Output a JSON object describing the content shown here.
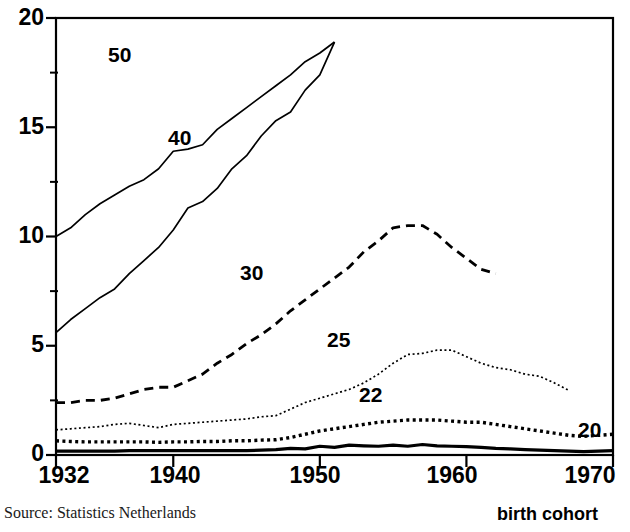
{
  "footer": {
    "source_text": "Source: Statistics Netherlands",
    "x_axis_caption": "birth cohort"
  },
  "colors": {
    "ink": "#000000",
    "background": "#ffffff"
  },
  "chart_data": {
    "type": "line",
    "title": "",
    "subtitle": "",
    "xlabel": "birth cohort",
    "ylabel": "",
    "grid": false,
    "legend_position": "inline-labels",
    "xlim": [
      1932,
      1970
    ],
    "ylim": [
      0,
      20
    ],
    "xticks": [
      1932,
      1940,
      1950,
      1960,
      1970
    ],
    "xtick_labels": [
      "1932",
      "1940",
      "1950",
      "1960",
      "1970"
    ],
    "yticks": [
      0,
      5,
      10,
      15,
      20
    ],
    "ytick_labels": [
      "0",
      "5",
      "10",
      "15",
      "20"
    ],
    "yminorticks": [
      2.5,
      7.5,
      12.5,
      17.5
    ],
    "series": [
      {
        "name": "50",
        "label": "50",
        "style": "solid-thin",
        "x": [
          1932,
          1933,
          1934,
          1935,
          1936,
          1937,
          1938,
          1939,
          1940,
          1941,
          1942,
          1943,
          1944,
          1945,
          1946,
          1947,
          1948,
          1949,
          1950,
          1951
        ],
        "values": [
          10.0,
          10.4,
          11.0,
          11.5,
          11.9,
          12.3,
          12.6,
          13.1,
          13.9,
          14.0,
          14.2,
          14.9,
          15.4,
          15.9,
          16.4,
          16.9,
          17.4,
          18.0,
          18.4,
          18.9
        ]
      },
      {
        "name": "40",
        "label": "40",
        "style": "solid-thin",
        "x": [
          1932,
          1933,
          1934,
          1935,
          1936,
          1937,
          1938,
          1939,
          1940,
          1941,
          1942,
          1943,
          1944,
          1945,
          1946,
          1947,
          1948,
          1949,
          1950,
          1951
        ],
        "values": [
          5.6,
          6.2,
          6.7,
          7.2,
          7.6,
          8.3,
          8.9,
          9.5,
          10.3,
          11.3,
          11.6,
          12.2,
          13.1,
          13.7,
          14.6,
          15.3,
          15.7,
          16.7,
          17.4,
          18.9
        ]
      },
      {
        "name": "30",
        "label": "30",
        "style": "dashed",
        "x": [
          1932,
          1933,
          1934,
          1935,
          1936,
          1937,
          1938,
          1939,
          1940,
          1941,
          1942,
          1943,
          1944,
          1945,
          1946,
          1947,
          1948,
          1949,
          1950,
          1951,
          1952,
          1953,
          1954,
          1955,
          1956,
          1957,
          1958,
          1959,
          1960,
          1961,
          1962
        ],
        "values": [
          2.4,
          2.4,
          2.5,
          2.5,
          2.6,
          2.8,
          3.0,
          3.1,
          3.1,
          3.4,
          3.7,
          4.2,
          4.6,
          5.1,
          5.5,
          6.0,
          6.6,
          7.1,
          7.6,
          8.1,
          8.6,
          9.3,
          9.8,
          10.4,
          10.5,
          10.5,
          10.1,
          9.5,
          9.0,
          8.5,
          8.3
        ]
      },
      {
        "name": "25",
        "label": "25",
        "style": "dotted-fine",
        "x": [
          1932,
          1933,
          1934,
          1935,
          1936,
          1937,
          1938,
          1939,
          1940,
          1941,
          1942,
          1943,
          1944,
          1945,
          1946,
          1947,
          1948,
          1949,
          1950,
          1951,
          1952,
          1953,
          1954,
          1955,
          1956,
          1957,
          1958,
          1959,
          1960,
          1961,
          1962,
          1963,
          1964,
          1965,
          1966,
          1967
        ],
        "values": [
          1.15,
          1.2,
          1.25,
          1.3,
          1.4,
          1.45,
          1.35,
          1.25,
          1.4,
          1.45,
          1.5,
          1.55,
          1.6,
          1.65,
          1.75,
          1.8,
          2.1,
          2.4,
          2.6,
          2.8,
          3.0,
          3.3,
          3.7,
          4.2,
          4.6,
          4.65,
          4.8,
          4.8,
          4.5,
          4.2,
          4.0,
          3.9,
          3.7,
          3.6,
          3.3,
          2.95
        ]
      },
      {
        "name": "22",
        "label": "22",
        "style": "dotted-coarse",
        "x": [
          1932,
          1933,
          1934,
          1935,
          1936,
          1937,
          1938,
          1939,
          1940,
          1941,
          1942,
          1943,
          1944,
          1945,
          1946,
          1947,
          1948,
          1949,
          1950,
          1951,
          1952,
          1953,
          1954,
          1955,
          1956,
          1957,
          1958,
          1959,
          1960,
          1961,
          1962,
          1963,
          1964,
          1965,
          1966,
          1967,
          1968,
          1969,
          1970
        ],
        "values": [
          0.65,
          0.62,
          0.6,
          0.6,
          0.6,
          0.6,
          0.6,
          0.58,
          0.6,
          0.6,
          0.62,
          0.62,
          0.65,
          0.65,
          0.68,
          0.7,
          0.8,
          0.95,
          1.1,
          1.2,
          1.3,
          1.4,
          1.5,
          1.55,
          1.6,
          1.6,
          1.6,
          1.55,
          1.5,
          1.5,
          1.4,
          1.3,
          1.2,
          1.1,
          1.0,
          0.9,
          0.85,
          0.9,
          0.95
        ]
      },
      {
        "name": "20",
        "label": "20",
        "style": "solid-thick",
        "x": [
          1932,
          1933,
          1934,
          1935,
          1936,
          1937,
          1938,
          1939,
          1940,
          1941,
          1942,
          1943,
          1944,
          1945,
          1946,
          1947,
          1948,
          1949,
          1950,
          1951,
          1952,
          1953,
          1954,
          1955,
          1956,
          1957,
          1958,
          1959,
          1960,
          1961,
          1962,
          1963,
          1964,
          1965,
          1966,
          1967,
          1968,
          1969,
          1970
        ],
        "values": [
          0.18,
          0.18,
          0.18,
          0.18,
          0.18,
          0.2,
          0.2,
          0.2,
          0.2,
          0.2,
          0.2,
          0.2,
          0.2,
          0.2,
          0.22,
          0.25,
          0.3,
          0.28,
          0.4,
          0.35,
          0.45,
          0.42,
          0.4,
          0.45,
          0.4,
          0.48,
          0.42,
          0.4,
          0.38,
          0.35,
          0.3,
          0.28,
          0.25,
          0.22,
          0.2,
          0.18,
          0.15,
          0.18,
          0.2
        ]
      }
    ],
    "series_label_positions": [
      {
        "name": "50",
        "left": 108,
        "top": 44
      },
      {
        "name": "40",
        "left": 168,
        "top": 127
      },
      {
        "name": "30",
        "left": 240,
        "top": 262
      },
      {
        "name": "25",
        "left": 327,
        "top": 329
      },
      {
        "name": "22",
        "left": 359,
        "top": 384
      },
      {
        "name": "20",
        "left": 578,
        "top": 419
      }
    ]
  }
}
